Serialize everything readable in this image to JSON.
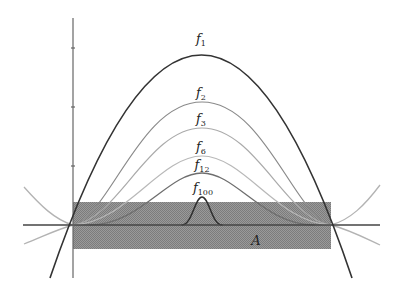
{
  "diagram": {
    "labels": {
      "f1": {
        "base": "f",
        "sub": "1"
      },
      "f2": {
        "base": "f",
        "sub": "2"
      },
      "f3": {
        "base": "f",
        "sub": "3"
      },
      "f6": {
        "base": "f",
        "sub": "6"
      },
      "f12": {
        "base": "f",
        "sub": "12"
      },
      "f100": {
        "base": "f",
        "sub": "100"
      },
      "set": "A"
    },
    "colors": {
      "f1": "#333333",
      "f2": "#8a8a8a",
      "f3": "#a8a8a8",
      "f6": "#b5b5b5",
      "f12": "#6e6e6e",
      "f100": "#2e2e2e",
      "outer": "#b0b0b0",
      "shade": "#8c8c8c",
      "axis": "#555555"
    },
    "peaks_px": {
      "f1": 29,
      "f2": 102,
      "f3": 128,
      "f6": 156,
      "f12": 173,
      "f100": 197
    }
  }
}
